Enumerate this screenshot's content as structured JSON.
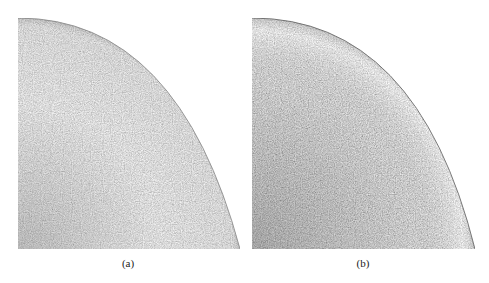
{
  "figure": {
    "panels": [
      {
        "label": "(a)",
        "description": "Quarter cross-section micrograph, lighter fine-grained structure",
        "tone": "#c9c9c9",
        "edge_tone": "#8a8a8a"
      },
      {
        "label": "(b)",
        "description": "Quarter cross-section micrograph, darker coarse dendritic structure",
        "tone": "#b4b4b4",
        "edge_tone": "#6e6e6e"
      }
    ]
  }
}
